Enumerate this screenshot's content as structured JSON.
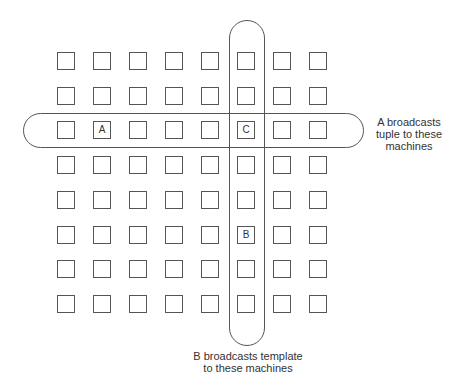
{
  "diagram": {
    "grid": {
      "rows": 8,
      "cols": 8
    },
    "nodes": {
      "A": {
        "label": "A",
        "row": 2,
        "col": 1
      },
      "C": {
        "label": "C",
        "row": 2,
        "col": 5
      },
      "B": {
        "label": "B",
        "row": 5,
        "col": 5
      }
    },
    "annotations": {
      "row_broadcast": "A broadcasts tuple to these machines",
      "row_broadcast_lines": [
        "A broadcasts",
        "tuple to these",
        "machines"
      ],
      "col_broadcast": "B broadcasts template to these machines",
      "col_broadcast_lines": [
        "B broadcasts template",
        "to these machines"
      ]
    },
    "colors": {
      "stroke": "#555555",
      "text": "#333333",
      "background": "#ffffff"
    }
  }
}
